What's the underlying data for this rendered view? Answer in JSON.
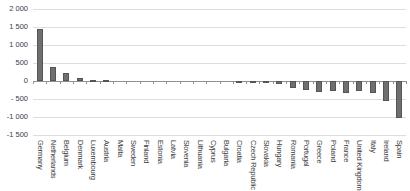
{
  "chart_data": {
    "type": "bar",
    "title": "",
    "xlabel": "",
    "ylabel": "",
    "ylim": [
      -1500,
      2000
    ],
    "grid": true,
    "legend": "none",
    "bar_color": "#6f6f6f",
    "bar_border_color": "#555555",
    "gridline_color": "#dedede",
    "zero_axis_color": "#8f8f8f",
    "ytick_values": [
      2000,
      1500,
      1000,
      500,
      0,
      -500,
      -1000,
      -1500
    ],
    "ytick_labels": [
      "2 000",
      "1 500",
      "1 000",
      "500",
      "0",
      "- 500",
      "-1 000",
      "-1 500"
    ],
    "categories": [
      "Germany",
      "Netherlands",
      "Belgium",
      "Denmark",
      "Luxembourg",
      "Austria",
      "Malta",
      "Sweden",
      "Finland",
      "Estonia",
      "Latvia",
      "Slovenia",
      "Lithuania",
      "Cyprus",
      "Bulgaria",
      "Croatia",
      "Czech Republic",
      "Slovakia",
      "Hungary",
      "Romania",
      "Portugal",
      "Greece",
      "Poland",
      "France",
      "United Kingdom",
      "Italy",
      "Ireland",
      "Spain"
    ],
    "values": [
      1450,
      400,
      220,
      95,
      30,
      15,
      10,
      5,
      5,
      5,
      0,
      0,
      0,
      -5,
      -10,
      -15,
      -30,
      -60,
      -80,
      -190,
      -250,
      -300,
      -280,
      -330,
      -290,
      -340,
      -550,
      -1030
    ]
  }
}
